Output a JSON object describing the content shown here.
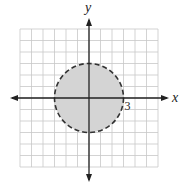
{
  "chart_data": {
    "type": "diagram",
    "title": "",
    "xlabel": "x",
    "ylabel": "y",
    "xlim": [
      -6,
      6
    ],
    "ylim": [
      -6,
      6
    ],
    "grid": true,
    "tick_labels": [
      {
        "value": 3,
        "axis": "x",
        "text": "3"
      }
    ],
    "shapes": [
      {
        "kind": "circle",
        "center": [
          0,
          0
        ],
        "radius": 3,
        "border": "dashed",
        "fill": "#d4d4d4",
        "stroke": "#333333",
        "meaning": "x^2 + y^2 < 9"
      }
    ]
  }
}
